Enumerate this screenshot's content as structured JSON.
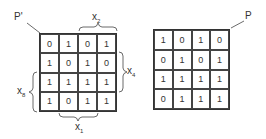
{
  "figure": {
    "left_matrix": {
      "label": "P'",
      "cells": [
        [
          "0",
          "1",
          "0",
          "1"
        ],
        [
          "1",
          "0",
          "1",
          "0"
        ],
        [
          "1",
          "1",
          "1",
          "1"
        ],
        [
          "1",
          "0",
          "1",
          "1"
        ]
      ],
      "variables": {
        "top": {
          "name": "x",
          "sub": "2",
          "spans_columns": [
            3,
            4
          ]
        },
        "right": {
          "name": "x",
          "sub": "4",
          "spans_rows": [
            2,
            3
          ]
        },
        "left": {
          "name": "x",
          "sub": "8",
          "spans_rows": [
            3,
            4
          ]
        },
        "bottom": {
          "name": "x",
          "sub": "1",
          "spans_columns": [
            2,
            3
          ]
        }
      }
    },
    "right_matrix": {
      "label": "P",
      "cells": [
        [
          "1",
          "0",
          "1",
          "0"
        ],
        [
          "0",
          "1",
          "0",
          "1"
        ],
        [
          "1",
          "1",
          "1",
          "1"
        ],
        [
          "0",
          "1",
          "1",
          "1"
        ]
      ]
    }
  }
}
